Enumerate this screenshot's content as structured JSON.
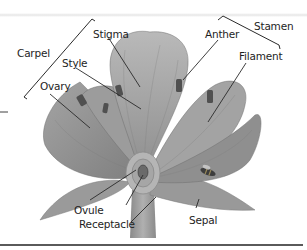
{
  "diagram": {
    "labels": {
      "carpel": "Carpel",
      "stigma": "Stigma",
      "style": "Style",
      "ovary": "Ovary",
      "anther": "Anther",
      "stamen": "Stamen",
      "filament": "Filament",
      "ovule": "Ovule",
      "receptacle": "Receptacle",
      "sepal": "Sepal"
    },
    "groups": [
      {
        "name": "Carpel",
        "parts": [
          "Stigma",
          "Style",
          "Ovary"
        ]
      },
      {
        "name": "Stamen",
        "parts": [
          "Anther",
          "Filament"
        ]
      }
    ],
    "colors": {
      "petal": "#a9a9a9",
      "petal_dark": "#8e8e8e",
      "anther": "#555555",
      "leader_line": "#2a2a2a",
      "text": "#1e1e1e"
    }
  }
}
